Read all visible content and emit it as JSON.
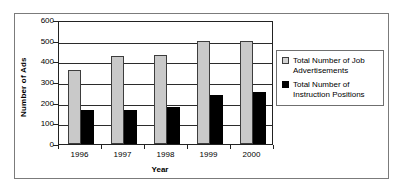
{
  "chart_data": {
    "type": "bar",
    "title": "",
    "xlabel": "Year",
    "ylabel": "Number of Ads",
    "categories": [
      "1996",
      "1997",
      "1998",
      "1999",
      "2000"
    ],
    "series": [
      {
        "name": "Total Number of Job Advertisements",
        "legend_line1": "Total Number of Job",
        "legend_line2": "Advertisements",
        "color": "#c9c9c9",
        "values": [
          360,
          425,
          430,
          500,
          500
        ]
      },
      {
        "name": "Total Number of Instruction Positions",
        "legend_line1": "Total Number of",
        "legend_line2": "Instruction Positions",
        "color": "#000000",
        "values": [
          165,
          165,
          180,
          235,
          250
        ]
      }
    ],
    "ylim": [
      0,
      600
    ],
    "ytick_labels": [
      "0",
      "100",
      "200",
      "300",
      "400",
      "500",
      "600"
    ],
    "ytick_values": [
      0,
      100,
      200,
      300,
      400,
      500,
      600
    ],
    "grid": "horizontal",
    "legend_position": "right"
  }
}
